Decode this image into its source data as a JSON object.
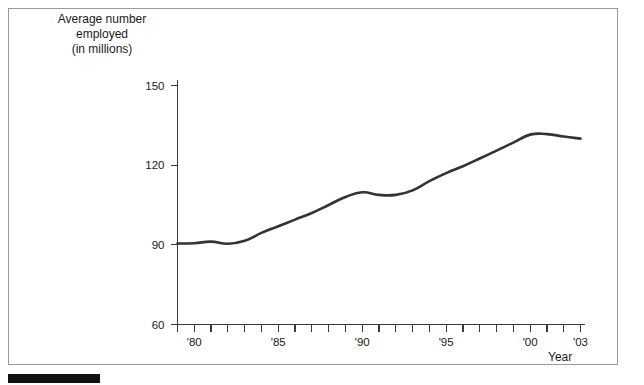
{
  "figure": {
    "background_color": "#ffffff",
    "frame_color": "#9a9a9a",
    "line_color": "#333333",
    "axis_color": "#3a3a3a",
    "source_bar_color": "#111111"
  },
  "axes": {
    "y_title_line1": "Average number",
    "y_title_line2": "employed",
    "y_title_line3": "(in millions)",
    "x_title": "Year"
  },
  "chart_data": {
    "type": "line",
    "title": "",
    "subtitle": "",
    "xlabel": "Year",
    "ylabel": "Average number employed (in millions)",
    "xlim": [
      1979,
      2003
    ],
    "ylim": [
      60,
      150
    ],
    "grid": false,
    "legend": "none",
    "y_ticks": [
      60,
      90,
      120,
      150
    ],
    "y_tick_labels": [
      "60",
      "90",
      "120",
      "150"
    ],
    "x_ticks": [
      1979,
      1980,
      1981,
      1982,
      1983,
      1984,
      1985,
      1986,
      1987,
      1988,
      1989,
      1990,
      1991,
      1992,
      1993,
      1994,
      1995,
      1996,
      1997,
      1998,
      1999,
      2000,
      2001,
      2002,
      2003
    ],
    "x_tick_labels": [
      "",
      "'80",
      "",
      "",
      "",
      "",
      "'85",
      "",
      "",
      "",
      "",
      "'90",
      "",
      "",
      "",
      "",
      "'95",
      "",
      "",
      "",
      "",
      "'00",
      "",
      "",
      "'03"
    ],
    "x_minor_tick_interval": 1,
    "series": [
      {
        "name": "Average number employed",
        "x": [
          1979,
          1980,
          1981,
          1982,
          1983,
          1984,
          1985,
          1986,
          1987,
          1988,
          1989,
          1990,
          1991,
          1992,
          1993,
          1994,
          1995,
          1996,
          1997,
          1998,
          1999,
          2000,
          2001,
          2002,
          2003
        ],
        "values": [
          90.5,
          90.6,
          91.2,
          90.4,
          91.5,
          94.5,
          97.0,
          99.5,
          102.0,
          105.0,
          108.0,
          109.8,
          108.8,
          108.8,
          110.5,
          114.0,
          117.0,
          119.6,
          122.5,
          125.5,
          128.5,
          131.5,
          131.7,
          130.8,
          130.0
        ]
      }
    ]
  }
}
